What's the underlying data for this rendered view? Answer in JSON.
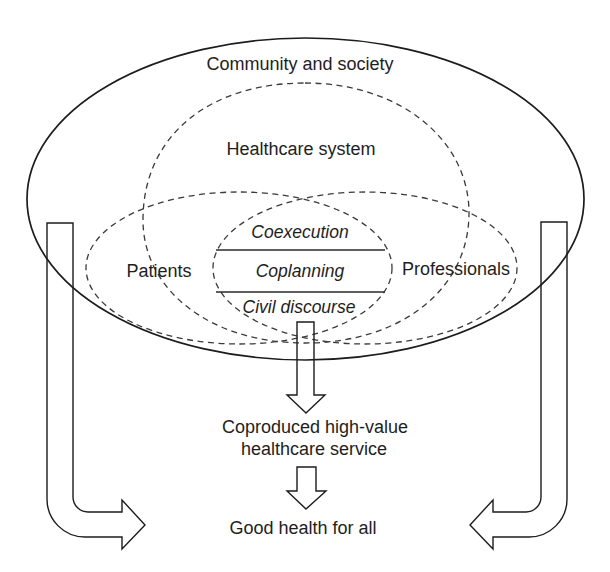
{
  "diagram": {
    "outer_region": {
      "label": "Community and society"
    },
    "healthcare_system": {
      "label": "Healthcare system"
    },
    "patients": {
      "label": "Patients"
    },
    "professionals": {
      "label": "Professionals"
    },
    "coproduction_layers": [
      {
        "label": "Coexecution"
      },
      {
        "label": "Coplanning"
      },
      {
        "label": "Civil discourse"
      }
    ],
    "result": {
      "line1": "Coproduced high-value",
      "line2": "healthcare service"
    },
    "outcome": {
      "label": "Good health for all"
    },
    "arrows": [
      {
        "name": "coproduction-to-service",
        "direction": "down"
      },
      {
        "name": "service-to-outcome",
        "direction": "down"
      },
      {
        "name": "community-left-to-outcome",
        "direction": "down-then-right"
      },
      {
        "name": "community-right-to-outcome",
        "direction": "down-then-left"
      }
    ]
  },
  "colors": {
    "background": "#ffffff",
    "stroke": "#1c1c1c",
    "text": "#1e1e1e"
  }
}
